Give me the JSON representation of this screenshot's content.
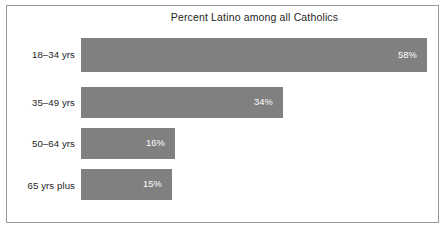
{
  "chart_data": {
    "type": "bar",
    "orientation": "horizontal",
    "title": "Percent Latino among all Catholics",
    "xlabel": "",
    "ylabel": "",
    "categories": [
      "18–34 yrs",
      "35–49 yrs",
      "50–64 yrs",
      "65 yrs plus"
    ],
    "values": [
      58,
      34,
      16,
      15
    ],
    "value_labels": [
      "58%",
      "34%",
      "16%",
      "15%"
    ],
    "xlim": [
      0,
      58
    ],
    "grid": false,
    "legend": false,
    "bar_color": "#808080",
    "value_label_color": "#ffffff",
    "frame_color": "#9a9a9a",
    "background": "#ffffff"
  },
  "layout": {
    "bar_left_px": 81,
    "rows": [
      {
        "label_top": 49,
        "bar_top": 38,
        "bar_height": 34,
        "bar_width": 346,
        "value_top": 50,
        "value_right_inset": 10
      },
      {
        "label_top": 97,
        "bar_top": 87,
        "bar_height": 31,
        "bar_width": 202,
        "value_top": 97,
        "value_right_inset": 10
      },
      {
        "label_top": 138,
        "bar_top": 128,
        "bar_height": 31,
        "bar_width": 94,
        "value_top": 138,
        "value_right_inset": 10
      },
      {
        "label_top": 180,
        "bar_top": 169,
        "bar_height": 31,
        "bar_width": 91,
        "value_top": 179,
        "value_right_inset": 10
      }
    ]
  }
}
